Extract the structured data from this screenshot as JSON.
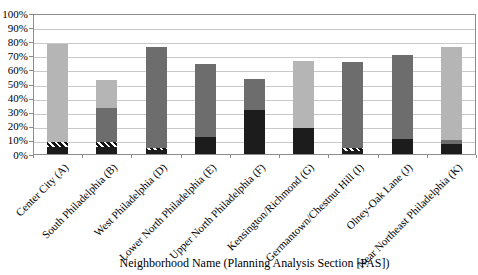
{
  "chart_data": {
    "type": "bar",
    "subtype": "stacked-100-percent",
    "title": "",
    "xlabel": "Neighborhood Name (Planning Analysis Section [PAS])",
    "ylabel": "",
    "ylim": [
      0,
      100
    ],
    "grid": "horizontal",
    "legend": "none",
    "y_ticks": [
      "100%",
      "90%",
      "80%",
      "70%",
      "60%",
      "50%",
      "40%",
      "30%",
      "20%",
      "10%",
      "0%"
    ],
    "categories": [
      "Center City (A)",
      "South Philadelphia (B)",
      "West Philadelphia (D)",
      "Lower North Philadelphia (E)",
      "Upper North Philadelphia (F)",
      "Kensington/Richmond (G)",
      "Germantown/Chestnut Hill (I)",
      "Olney-Oak Lane (J)",
      "Near Northeast Philadelphia (K)"
    ],
    "series": [
      {
        "name": "light-gray-segment",
        "style": "solid",
        "color": "#b5b5b5",
        "values": [
          79,
          53,
          16,
          19,
          10,
          67,
          28,
          10,
          77
        ]
      },
      {
        "name": "medium-gray-segment",
        "style": "solid",
        "color": "#6d6d6d",
        "values": [
          7,
          33,
          77,
          65,
          54,
          9,
          66,
          71,
          10
        ]
      },
      {
        "name": "hatched-segment",
        "style": "diagonal-hatch",
        "color": "#141414",
        "background": "#ffffff",
        "values": [
          9,
          9,
          4,
          4,
          4,
          5,
          4,
          8,
          6
        ]
      },
      {
        "name": "black-segment",
        "style": "solid",
        "color": "#1c1c1c",
        "values": [
          5,
          5,
          3,
          12,
          32,
          19,
          2,
          11,
          7
        ]
      }
    ],
    "colors": {
      "gridline": "#c9c9c9",
      "axis": "#8c8c8c",
      "plot_background": "#ffffff",
      "chart_background": "#ffffff"
    }
  }
}
